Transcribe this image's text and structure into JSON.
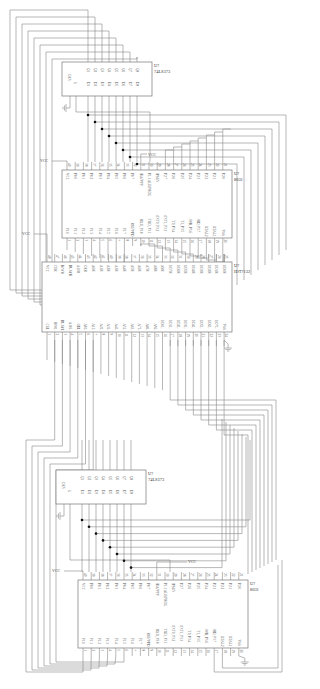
{
  "diagram": {
    "orientation": "rotated 90 degrees clockwise",
    "line_color": "#888888",
    "junction_color": "#111111",
    "supply_label": "VCC",
    "components": [
      {
        "id": "latch_top",
        "ref": "U?",
        "part": "74LS373",
        "pins_in": [
          "D1",
          "D2",
          "D3",
          "D4",
          "D5",
          "D6",
          "D7",
          "D8"
        ],
        "pins_out": [
          "Q1",
          "Q2",
          "Q3",
          "Q4",
          "Q5",
          "Q6",
          "Q7",
          "Q8"
        ],
        "controls": [
          "OEN",
          "G"
        ]
      },
      {
        "id": "mcu_top",
        "ref": "U?",
        "part": "8031",
        "pins_left": [
          "P1.0",
          "P1.1",
          "P1.2",
          "P1.3",
          "P1.4",
          "P1.5",
          "P1.6",
          "P1.7",
          "RST/VPD",
          "RXD, P3.0",
          "TXD, P3.1",
          "/INT0, P3.2",
          "/INT1, P3.3",
          "T0, P3.4",
          "T1, P3.5",
          "/WR, P3.6",
          "/RD, P3.7",
          "XTAL2",
          "XTAL1",
          "VSS"
        ],
        "pins_left_nums": [
          "1",
          "2",
          "3",
          "4",
          "5",
          "6",
          "7",
          "8",
          "9",
          "10",
          "11",
          "12",
          "13",
          "14",
          "15",
          "16",
          "17",
          "18",
          "19",
          "20"
        ],
        "pins_right": [
          "VCC",
          "P0.0",
          "P0.1",
          "P0.2",
          "P0.3",
          "P0.4",
          "P0.5",
          "P0.6",
          "P0.7",
          "/EA/VPP",
          "P1.1 ALE/PROG",
          "/PSEN",
          "P2.7",
          "P2.6",
          "P2.5",
          "P2.4",
          "P2.3",
          "P2.2",
          "P2.1",
          "P2.0"
        ],
        "pins_right_nums": [
          "40",
          "39",
          "38",
          "37",
          "36",
          "35",
          "34",
          "33",
          "32",
          "31",
          "30",
          "29",
          "28",
          "27",
          "26",
          "25",
          "24",
          "23",
          "22",
          "21"
        ]
      },
      {
        "id": "dpram",
        "ref": "U?",
        "part": "IDT7132",
        "pins_left": [
          "CEL",
          "R/WL",
          "BUSYL",
          "A10L",
          "OEL",
          "A0L",
          "A1L",
          "A2L",
          "A3L",
          "A4L",
          "A5L",
          "A6L",
          "A7L",
          "A8L",
          "A9L",
          "I/O0L",
          "I/O1L",
          "I/O2L",
          "I/O3L",
          "I/O4L",
          "I/O5L",
          "I/O6L",
          "I/O7L",
          "VSS"
        ],
        "pins_left_nums": [
          "1",
          "2",
          "3",
          "4",
          "5",
          "6",
          "7",
          "8",
          "9",
          "10",
          "11",
          "12",
          "13",
          "14",
          "15",
          "16",
          "17",
          "18",
          "19",
          "20",
          "21",
          "22",
          "23",
          "24"
        ],
        "pins_right": [
          "VCC",
          "CER",
          "R/WR",
          "BUSYR",
          "A10R",
          "OER",
          "A0R",
          "A1R",
          "A2R",
          "A3R",
          "A4R",
          "A5R",
          "A6R",
          "A7R",
          "A8R",
          "A9R",
          "I/O7R",
          "I/O6R",
          "I/O5R",
          "I/O4R",
          "I/O3R",
          "I/O2R",
          "I/O1R",
          "I/O0R"
        ],
        "pins_right_nums": [
          "48",
          "47",
          "46",
          "45",
          "44",
          "43",
          "42",
          "41",
          "40",
          "39",
          "38",
          "37",
          "36",
          "35",
          "34",
          "33",
          "32",
          "31",
          "30",
          "29",
          "28",
          "27",
          "26",
          "25"
        ]
      },
      {
        "id": "latch_bottom",
        "ref": "U?",
        "part": "74LS373",
        "pins_in": [
          "D1",
          "D2",
          "D3",
          "D4",
          "D5",
          "D6",
          "D7",
          "D8"
        ],
        "pins_out": [
          "Q1",
          "Q2",
          "Q3",
          "Q4",
          "Q5",
          "Q6",
          "Q7",
          "Q8"
        ],
        "controls": [
          "OEN",
          "G"
        ]
      },
      {
        "id": "mcu_bottom",
        "ref": "U?",
        "part": "8031",
        "pins_left": [
          "P1.0",
          "P1.1",
          "P1.2",
          "P1.3",
          "P1.4",
          "P1.5",
          "P1.6",
          "P1.7",
          "RST/VPD",
          "RXD, P3.0",
          "TXD, P3.1",
          "/INT0, P3.2",
          "/INT1, P3.3",
          "T0, P3.4",
          "T1, P3.5",
          "/WR, P3.6",
          "/RD, P3.7",
          "XTAL2",
          "XTAL1",
          "VSS"
        ],
        "pins_left_nums": [
          "1",
          "2",
          "3",
          "4",
          "5",
          "6",
          "7",
          "8",
          "9",
          "10",
          "11",
          "12",
          "13",
          "14",
          "15",
          "16",
          "17",
          "18",
          "19",
          "20"
        ],
        "pins_right": [
          "VCC",
          "P0.0",
          "P0.1",
          "P0.2",
          "P0.3",
          "P0.4",
          "P0.5",
          "P0.6",
          "P0.7",
          "/EA/VPP",
          "P1.1 ALE/PROG",
          "/PSEN",
          "P2.7",
          "P2.6",
          "P2.5",
          "P2.4",
          "P2.3",
          "P2.2",
          "P2.1",
          "P2.0"
        ],
        "pins_right_nums": [
          "40",
          "39",
          "38",
          "37",
          "36",
          "35",
          "34",
          "33",
          "32",
          "31",
          "30",
          "29",
          "28",
          "27",
          "26",
          "25",
          "24",
          "23",
          "22",
          "21"
        ]
      }
    ],
    "labels": {
      "vcc_top_mcu": "VCC",
      "vcc_top_mcu_ea": "VCC",
      "vcc_dpram": "VCC",
      "vcc_bottom_mcu": "VCC",
      "vcc_bottom_mcu_ea": "VCC"
    }
  }
}
